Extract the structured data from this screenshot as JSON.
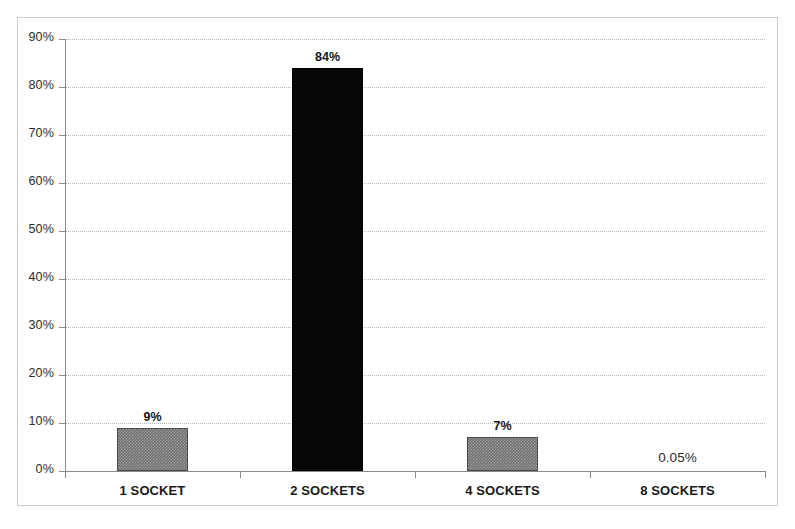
{
  "chart_data": {
    "type": "bar",
    "title": "",
    "subtitle": "",
    "xlabel": "",
    "ylabel": "",
    "categories": [
      "1 SOCKET",
      "2 SOCKETS",
      "4 SOCKETS",
      "8 SOCKETS"
    ],
    "values": [
      9,
      84,
      7,
      0.05
    ],
    "value_labels": [
      "9%",
      "84%",
      "7%",
      "0.05%"
    ],
    "bar_colors": [
      "#6f6f6f",
      "#070707",
      "#6f6f6f",
      "#6f6f6f"
    ],
    "ylim": [
      0,
      90
    ],
    "ytick_labels": [
      "0%",
      "10%",
      "20%",
      "30%",
      "40%",
      "50%",
      "60%",
      "70%",
      "80%",
      "90%"
    ],
    "ytick_values": [
      0,
      10,
      20,
      30,
      40,
      50,
      60,
      70,
      80,
      90
    ],
    "grid": true,
    "grid_style": "dotted",
    "grid_color": "#b8b8b8",
    "legend": "none",
    "axis_color": "#8a8a8a",
    "frame_color": "#c9c9c9",
    "background": "#ffffff"
  }
}
